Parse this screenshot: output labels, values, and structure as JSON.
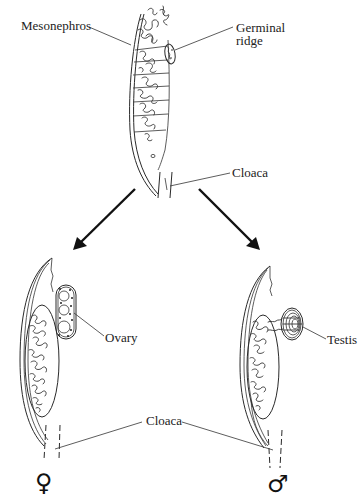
{
  "diagram": {
    "type": "biology-schematic",
    "top": {
      "labels": {
        "mesonephros": "Mesonephros",
        "germinal_ridge_line1": "Germinal",
        "germinal_ridge_line2": "ridge",
        "cloaca": "Cloaca"
      }
    },
    "arrows": [
      {
        "name": "to-female",
        "direction": "down-left"
      },
      {
        "name": "to-male",
        "direction": "down-right"
      }
    ],
    "female": {
      "labels": {
        "ovary": "Ovary"
      },
      "symbol": "♀"
    },
    "male": {
      "labels": {
        "testis": "Testis"
      },
      "symbol": "♂"
    },
    "shared": {
      "cloaca_bottom": "Cloaca"
    },
    "colors": {
      "line": "#2a2a2a",
      "background": "#ffffff"
    }
  }
}
